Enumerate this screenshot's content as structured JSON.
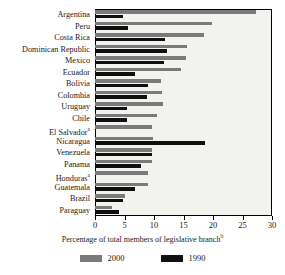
{
  "chart_data": {
    "type": "bar",
    "orientation": "horizontal",
    "title": "",
    "xlabel": "Percentage of total members of legislative branch",
    "xlabel_superscript": "b",
    "ylabel": "",
    "xlim": [
      0,
      30
    ],
    "xticks": [
      0,
      5,
      10,
      15,
      20,
      25,
      30
    ],
    "grid": false,
    "legend_position": "bottom",
    "categories": [
      "Argentina",
      "Peru",
      "Costa Rica",
      "Dominican Republic",
      "Mexico",
      "Ecuador",
      "Bolivia",
      "Colombia",
      "Uruguay",
      "Chile",
      "El Salvador",
      "Nicaragua",
      "Venezuela",
      "Panama",
      "Honduras",
      "Guatemala",
      "Brazil",
      "Paraguay"
    ],
    "category_superscripts": {
      "El Salvador": "a",
      "Honduras": "a"
    },
    "series": [
      {
        "name": "2000",
        "color": "#7a7a7a",
        "values": [
          27.3,
          19.9,
          18.4,
          15.6,
          15.5,
          14.6,
          11.2,
          11.3,
          11.5,
          10.5,
          9.6,
          9.8,
          9.6,
          9.6,
          9.0,
          8.9,
          5.1,
          2.8
        ]
      },
      {
        "name": "1990",
        "color": "#0f0f0f",
        "values": [
          4.8,
          5.6,
          11.9,
          12.2,
          11.7,
          6.8,
          8.9,
          8.8,
          5.5,
          5.5,
          null,
          18.7,
          9.7,
          7.8,
          null,
          6.8,
          4.7,
          4.0
        ]
      }
    ]
  },
  "legend": {
    "items": [
      {
        "label": "2000",
        "color": "#7a7a7a"
      },
      {
        "label": "1990",
        "color": "#0f0f0f"
      }
    ]
  },
  "axis": {
    "tick_labels": [
      "0",
      "5",
      "10",
      "15",
      "20",
      "25",
      "30"
    ]
  }
}
